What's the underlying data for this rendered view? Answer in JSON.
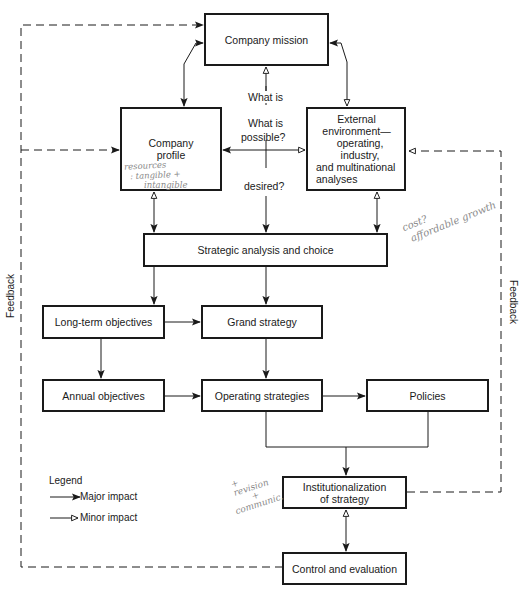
{
  "diagram": {
    "type": "strategic-management-process-flowchart",
    "boxes": {
      "mission": "Company mission",
      "profile": "Company profile",
      "external": [
        "External environment—",
        "operating, industry,",
        "and multinational",
        "analyses"
      ],
      "strategic_analysis": "Strategic analysis and choice",
      "long_term_objectives": "Long-term objectives",
      "grand_strategy": "Grand strategy",
      "annual_objectives": "Annual objectives",
      "operating_strategies": "Operating strategies",
      "policies": "Policies",
      "institutionalization": [
        "Institutionalization",
        "of strategy"
      ],
      "control": "Control and evaluation"
    },
    "center_labels": {
      "what_is": "What is",
      "what_is_possible_1": "What is",
      "what_is_possible_2": "possible?",
      "desired": "desired?"
    },
    "feedback_left": "Feedback",
    "feedback_right": "Feedback",
    "legend": {
      "title": "Legend",
      "major": "Major impact",
      "minor": "Minor impact"
    },
    "handwritten": {
      "profile_note": [
        "resources",
        ": tangible +",
        "intangible"
      ],
      "cost_note": [
        "cost?",
        "affordable growth"
      ],
      "revision_note": [
        "+",
        "revision",
        "+",
        "communic."
      ]
    },
    "colors": {
      "line": "#1a1a1a",
      "handwriting": "#8a8a8a",
      "background": "#ffffff"
    }
  }
}
